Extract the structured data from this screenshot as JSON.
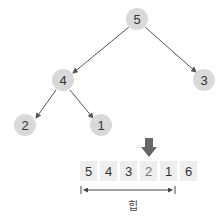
{
  "tree": {
    "nodes": [
      {
        "id": "n0",
        "value": "5"
      },
      {
        "id": "n1",
        "value": "4"
      },
      {
        "id": "n2",
        "value": "3"
      },
      {
        "id": "n3",
        "value": "2"
      },
      {
        "id": "n4",
        "value": "1"
      }
    ],
    "edges": [
      [
        "n0",
        "n1"
      ],
      [
        "n0",
        "n2"
      ],
      [
        "n1",
        "n3"
      ],
      [
        "n1",
        "n4"
      ]
    ]
  },
  "array": {
    "cells": [
      "5",
      "4",
      "3",
      "2",
      "1",
      "6"
    ],
    "highlight_index": 3,
    "pointer_icon": "down-arrow-icon"
  },
  "range": {
    "label": "힙",
    "span": "cells 0-4"
  },
  "colors": {
    "node_fill": "#d9d9d9",
    "cell_fill": "#eeeeee",
    "edge": "#555555",
    "pointer": "#666666"
  }
}
